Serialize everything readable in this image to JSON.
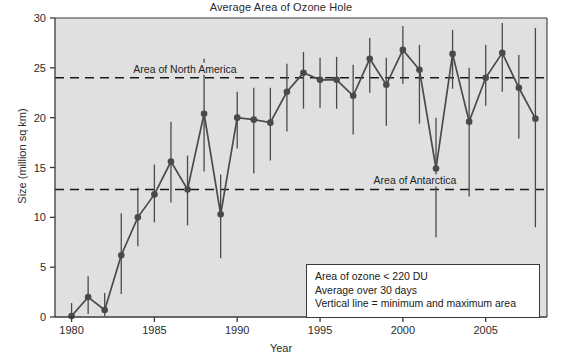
{
  "chart_data": {
    "type": "line",
    "title": "Average Area of Ozone Hole",
    "xlabel": "Year",
    "ylabel": "Size (million sq km)",
    "xlim": [
      1979,
      2008.7
    ],
    "ylim": [
      0,
      30
    ],
    "grid": false,
    "legend_position": "inside-bottom-right",
    "x": [
      1980,
      1981,
      1982,
      1983,
      1984,
      1985,
      1986,
      1987,
      1988,
      1989,
      1990,
      1991,
      1992,
      1993,
      1994,
      1995,
      1996,
      1997,
      1998,
      1999,
      2000,
      2001,
      2002,
      2003,
      2004,
      2005,
      2006,
      2007,
      2008
    ],
    "series": [
      {
        "name": "Average area of ozone hole",
        "values": [
          0.1,
          2.0,
          0.7,
          6.2,
          10.0,
          12.3,
          15.6,
          12.8,
          20.4,
          10.3,
          20.0,
          19.8,
          19.5,
          22.6,
          24.5,
          23.8,
          23.8,
          22.2,
          25.9,
          23.3,
          26.8,
          24.8,
          14.9,
          26.4,
          19.6,
          24.0,
          26.5,
          23.0,
          19.9
        ],
        "min": [
          0.0,
          0.3,
          0.1,
          2.3,
          7.1,
          9.5,
          11.5,
          9.2,
          14.6,
          5.9,
          16.9,
          14.4,
          15.7,
          18.6,
          20.9,
          21.0,
          20.9,
          18.3,
          22.5,
          19.2,
          23.4,
          19.4,
          8.0,
          22.9,
          12.1,
          21.2,
          22.6,
          17.9,
          9.0
        ],
        "max": [
          1.4,
          4.1,
          2.4,
          10.4,
          13.0,
          15.3,
          19.6,
          16.2,
          25.9,
          14.3,
          22.6,
          23.0,
          23.0,
          25.4,
          26.6,
          26.0,
          26.1,
          25.3,
          28.0,
          26.0,
          29.2,
          27.3,
          20.0,
          28.8,
          25.0,
          27.3,
          29.5,
          26.3,
          29.0
        ]
      }
    ],
    "y_ticks": [
      0,
      5,
      10,
      15,
      20,
      25,
      30
    ],
    "x_ticks": [
      1980,
      1985,
      1990,
      1995,
      2000,
      2005
    ],
    "reference_lines": [
      {
        "label": "Area of North America",
        "value": 24.0
      },
      {
        "label": "Area of Antarctica",
        "value": 12.8
      }
    ],
    "legend_lines": [
      "Area of ozone < 220 DU",
      "Average over 30 days",
      "Vertical line = minimum and maximum area"
    ],
    "colors": {
      "series": "#4a4a4a",
      "plot_background": "#e0e0e0",
      "axis": "#3a3a3a",
      "reference_line": "#1a1a1a"
    }
  }
}
